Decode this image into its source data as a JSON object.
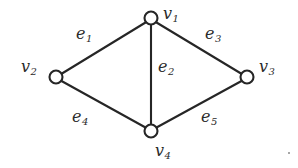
{
  "figure": {
    "kind": "undirected-graph-diagram",
    "width": 298,
    "height": 168,
    "background_color": "#ffffff",
    "stroke_color": "#262626",
    "text_color": "#2b2b2b"
  },
  "vertices": [
    {
      "id": "v1",
      "label_base": "v",
      "label_sub": "1",
      "cx": 151,
      "cy": 18,
      "r": 6.5,
      "label_x": 163,
      "label_y": 6
    },
    {
      "id": "v2",
      "label_base": "v",
      "label_sub": "2",
      "cx": 56,
      "cy": 77,
      "r": 6.5,
      "label_x": 21,
      "label_y": 59
    },
    {
      "id": "v3",
      "label_base": "v",
      "label_sub": "3",
      "cx": 247,
      "cy": 77,
      "r": 6.5,
      "label_x": 259,
      "label_y": 59
    },
    {
      "id": "v4",
      "label_base": "v",
      "label_sub": "4",
      "cx": 151,
      "cy": 131,
      "r": 6.5,
      "label_x": 155,
      "label_y": 143
    }
  ],
  "edges": [
    {
      "id": "e1",
      "from": "v1",
      "to": "v2",
      "label_base": "e",
      "label_sub": "1",
      "x1": 145.5,
      "y1": 22.5,
      "x2": 62.0,
      "y2": 73.5,
      "label_x": 76,
      "label_y": 26
    },
    {
      "id": "e2",
      "from": "v1",
      "to": "v4",
      "label_base": "e",
      "label_sub": "2",
      "x1": 151,
      "y1": 24.5,
      "x2": 151,
      "y2": 124.5,
      "label_x": 158,
      "label_y": 59
    },
    {
      "id": "e3",
      "from": "v1",
      "to": "v3",
      "label_base": "e",
      "label_sub": "3",
      "x1": 156.5,
      "y1": 22.5,
      "x2": 241.0,
      "y2": 73.5,
      "label_x": 205,
      "label_y": 26
    },
    {
      "id": "e4",
      "from": "v2",
      "to": "v4",
      "label_base": "e",
      "label_sub": "4",
      "x1": 61.5,
      "y1": 81.0,
      "x2": 145.5,
      "y2": 127.5,
      "label_x": 72,
      "label_y": 109
    },
    {
      "id": "e5",
      "from": "v4",
      "to": "v3",
      "label_base": "e",
      "label_sub": "5",
      "x1": 156.5,
      "y1": 127.5,
      "x2": 241.5,
      "y2": 81.0,
      "label_x": 201,
      "label_y": 109
    }
  ]
}
